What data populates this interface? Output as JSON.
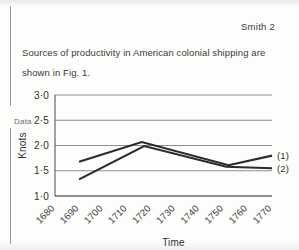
{
  "page": {
    "running_header": "Smith 2",
    "margin_annotation": "Data",
    "body_text": "Sources of productivity in American colonial shipping are shown in Fig. 1."
  },
  "chart_data": {
    "type": "line",
    "title": "",
    "xlabel": "Time",
    "ylabel": "Knots",
    "xlim": [
      1680,
      1770
    ],
    "ylim": [
      1.0,
      3.0
    ],
    "grid": true,
    "legend_position": "right-inline",
    "x": [
      1680,
      1690,
      1700,
      1710,
      1720,
      1730,
      1740,
      1750,
      1760,
      1770
    ],
    "xtick_labels": [
      "1680",
      "1690",
      "1700",
      "1710",
      "1720",
      "1730",
      "1740",
      "1750",
      "1760",
      "1770"
    ],
    "ytick_labels": [
      "3·0",
      "2·5",
      "2·0",
      "1·5",
      "1·0"
    ],
    "ytick_values": [
      3.0,
      2.5,
      2.0,
      1.5,
      1.0
    ],
    "series": [
      {
        "name": "(1)",
        "label": "(1)",
        "color": "#2a2a2a",
        "x": [
          1690,
          1716,
          1752,
          1770
        ],
        "values": [
          1.68,
          2.07,
          1.61,
          1.8
        ]
      },
      {
        "name": "(2)",
        "label": "(2)",
        "color": "#2a2a2a",
        "x": [
          1690,
          1717,
          1751,
          1770
        ],
        "values": [
          1.33,
          1.99,
          1.58,
          1.55
        ]
      }
    ]
  }
}
